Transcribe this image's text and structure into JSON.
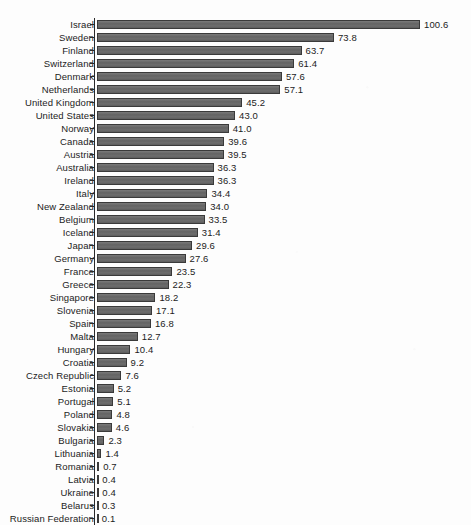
{
  "chart_data": {
    "type": "bar",
    "orientation": "horizontal",
    "title": "",
    "subtitle": "",
    "xlabel": "",
    "ylabel": "",
    "grid": false,
    "legend": null,
    "value_labels": true,
    "value_label_format": "one-decimal",
    "xlim": [
      0,
      100.6
    ],
    "sorted": "descending",
    "categories": [
      "Israel",
      "Sweden",
      "Finland",
      "Switzerland",
      "Denmark",
      "Netherlands",
      "United Kingdom",
      "United States",
      "Norway",
      "Canada",
      "Austria",
      "Australia",
      "Ireland",
      "Italy",
      "New Zealand",
      "Belgium",
      "Iceland",
      "Japan",
      "Germany",
      "France",
      "Greece",
      "Singapore",
      "Slovenia",
      "Spain",
      "Malta",
      "Hungary",
      "Croatia",
      "Czech Republic",
      "Estonia",
      "Portugal",
      "Poland",
      "Slovakia",
      "Bulgaria",
      "Lithuania",
      "Romania",
      "Latvia",
      "Ukraine",
      "Belarus",
      "Russian Federation"
    ],
    "values": [
      100.6,
      73.8,
      63.7,
      61.4,
      57.6,
      57.1,
      45.2,
      43.0,
      41.0,
      39.6,
      39.5,
      36.3,
      36.3,
      34.4,
      34.0,
      33.5,
      31.4,
      29.6,
      27.6,
      23.5,
      22.3,
      18.2,
      17.1,
      16.8,
      12.7,
      10.4,
      9.2,
      7.6,
      5.2,
      5.1,
      4.8,
      4.6,
      2.3,
      1.4,
      0.7,
      0.4,
      0.4,
      0.3,
      0.1
    ],
    "value_labels_text": [
      "100.6",
      "73.8",
      "63.7",
      "61.4",
      "57.6",
      "57.1",
      "45.2",
      "43.0",
      "41.0",
      "39.6",
      "39.5",
      "36.3",
      "36.3",
      "34.4",
      "34.0",
      "33.5",
      "31.4",
      "29.6",
      "27.6",
      "23.5",
      "22.3",
      "18.2",
      "17.1",
      "16.8",
      "12.7",
      "10.4",
      "9.2",
      "7.6",
      "5.2",
      "5.1",
      "4.8",
      "4.6",
      "2.3",
      "1.4",
      "0.7",
      "0.4",
      "0.4",
      "0.3",
      "0.1"
    ],
    "colors": {
      "bar_fill": "#6e6e6e",
      "bar_stroke": "#3a3a3a",
      "axis": "#2a2a2a",
      "text": "#1c1c1c",
      "background": "#fdfdfd"
    }
  }
}
